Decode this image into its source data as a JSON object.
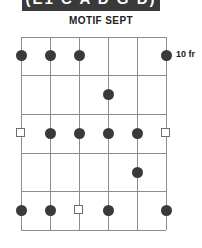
{
  "header": {
    "banner_text": "(E1 C A D G D)",
    "banner_bg": "#3a3a3a",
    "banner_fg": "#ffffff"
  },
  "title": {
    "text": "MOTIF SEPT"
  },
  "labels": {
    "fret_position": "10 fr"
  },
  "colors": {
    "grid": "#8d8d8d",
    "dot": "#3a3a3a",
    "marker_outline": "#6e6e6e",
    "text": "#222222",
    "background": "#ffffff"
  },
  "chart_data": {
    "type": "table",
    "title": "MOTIF SEPT",
    "xlabel": "Strings",
    "ylabel": "Frets",
    "position_label": "10 fr",
    "strings": 6,
    "frets": 5,
    "string_x": [
      21,
      50,
      79,
      108,
      137,
      166
    ],
    "fret_y": [
      37,
      75,
      114,
      153,
      191,
      230
    ],
    "row_centers": [
      55,
      94,
      133,
      172,
      210
    ],
    "categories": [
      "String 1",
      "String 2",
      "String 3",
      "String 4",
      "String 5",
      "String 6"
    ],
    "legend": [
      {
        "name": "filled-dot",
        "meaning": "fretted note",
        "color": "#3a3a3a"
      },
      {
        "name": "open-square",
        "meaning": "root or open marker",
        "color": "#6e6e6e"
      }
    ],
    "markers": [
      {
        "fret": 1,
        "string": 1,
        "shape": "dot",
        "x": 21,
        "y": 55
      },
      {
        "fret": 1,
        "string": 2,
        "shape": "dot",
        "x": 50,
        "y": 55
      },
      {
        "fret": 1,
        "string": 3,
        "shape": "dot",
        "x": 79,
        "y": 55
      },
      {
        "fret": 1,
        "string": 6,
        "shape": "dot",
        "x": 166,
        "y": 55
      },
      {
        "fret": 2,
        "string": 4,
        "shape": "dot",
        "x": 108,
        "y": 94
      },
      {
        "fret": 3,
        "string": 1,
        "shape": "square",
        "x": 21,
        "y": 133
      },
      {
        "fret": 3,
        "string": 2,
        "shape": "dot",
        "x": 50,
        "y": 133
      },
      {
        "fret": 3,
        "string": 3,
        "shape": "dot",
        "x": 79,
        "y": 133
      },
      {
        "fret": 3,
        "string": 4,
        "shape": "dot",
        "x": 108,
        "y": 133
      },
      {
        "fret": 3,
        "string": 5,
        "shape": "dot",
        "x": 137,
        "y": 133
      },
      {
        "fret": 3,
        "string": 6,
        "shape": "square",
        "x": 166,
        "y": 133
      },
      {
        "fret": 4,
        "string": 5,
        "shape": "dot",
        "x": 137,
        "y": 172
      },
      {
        "fret": 5,
        "string": 1,
        "shape": "dot",
        "x": 21,
        "y": 210
      },
      {
        "fret": 5,
        "string": 2,
        "shape": "dot",
        "x": 50,
        "y": 210
      },
      {
        "fret": 5,
        "string": 3,
        "shape": "square",
        "x": 79,
        "y": 210
      },
      {
        "fret": 5,
        "string": 4,
        "shape": "dot",
        "x": 108,
        "y": 210
      },
      {
        "fret": 5,
        "string": 6,
        "shape": "dot",
        "x": 166,
        "y": 210
      }
    ]
  }
}
